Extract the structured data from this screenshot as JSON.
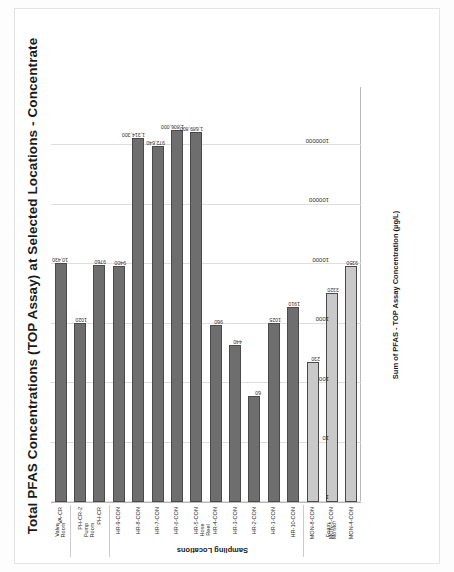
{
  "chart_data": {
    "type": "bar",
    "orientation": "horizontal",
    "title": "Total PFAS Concentrations (TOP Assay) at Selected Locations - Concentrate",
    "xlabel": "Sum of PFAS - TOP Assay Concentration (µg/L)",
    "ylabel": "Sampling Locations",
    "xscale": "log",
    "xlim": [
      1,
      10000000
    ],
    "xticks": [
      1000000,
      100000,
      10000,
      1000,
      100,
      10,
      1
    ],
    "xtick_labels": [
      "1000000",
      "100000",
      "10000",
      "1000",
      "100",
      "10",
      "1"
    ],
    "grid": true,
    "legend": "none",
    "categories": [
      "VA-CR",
      "PH-CR-2",
      "PH-CR",
      "HR-9-CON",
      "HR-8-CON",
      "HR-7-CON",
      "HR-6-CON",
      "HR-5-CON",
      "HR-4-CON",
      "HR-3-CON",
      "HR-2-CON",
      "HR-1-CON",
      "HR-10-CON",
      "MON-8-CON",
      "MON-5-CON",
      "MON-4-CON"
    ],
    "values": [
      10430,
      1020,
      9760,
      9400,
      1314300,
      972640,
      1806000,
      1689800,
      960,
      440,
      60,
      1025,
      1910,
      230,
      3320,
      9350
    ],
    "value_labels": [
      "10,430",
      "1020",
      "9760",
      "9400",
      "1,314,300",
      "972,640",
      "1,806,000",
      "1,689,800",
      "960",
      "440",
      "60",
      "1025",
      "1910",
      "230",
      "3320",
      "9350"
    ],
    "bar_shades": [
      "dark",
      "dark",
      "dark",
      "dark",
      "dark",
      "dark",
      "dark",
      "dark",
      "dark",
      "dark",
      "dark",
      "dark",
      "dark",
      "light",
      "light",
      "light"
    ],
    "colors": {
      "dark_bar": "#6e6e6e",
      "light_bar": "#c9c9c9",
      "grid": "#dedede",
      "axis": "#b9b9b9"
    },
    "groups": [
      {
        "label": "Valve Room",
        "start": 0,
        "end": 0
      },
      {
        "label": "Pump Room",
        "start": 1,
        "end": 2
      },
      {
        "label": "Hose Reel",
        "start": 3,
        "end": 12
      },
      {
        "label": "Foam Monitor",
        "start": 13,
        "end": 15
      }
    ]
  }
}
